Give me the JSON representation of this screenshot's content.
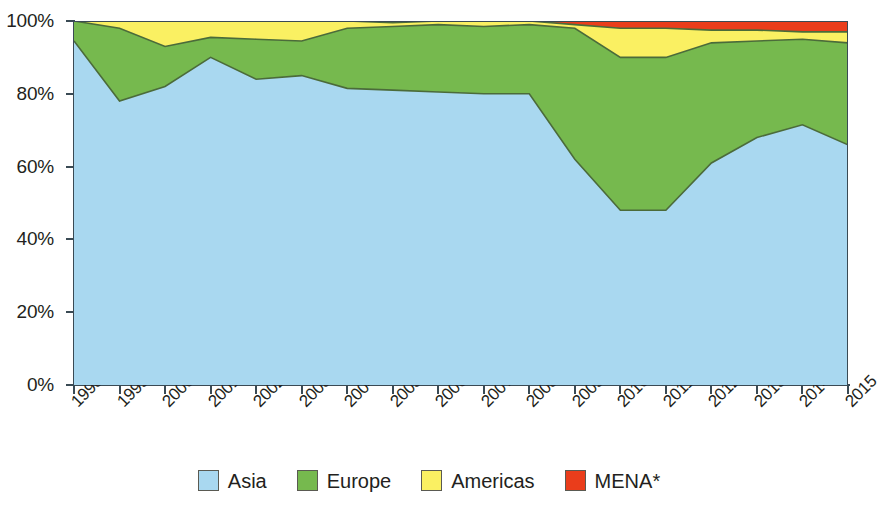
{
  "chart_data": {
    "type": "area",
    "stacked": true,
    "stack_total": 100,
    "title": "",
    "subtitle": "",
    "xlabel": "",
    "ylabel": "",
    "categories": [
      "1998",
      "1999",
      "2000",
      "2001",
      "2002",
      "2003",
      "2004",
      "2005",
      "2006",
      "2007",
      "2008",
      "2009",
      "2010",
      "2011",
      "2012",
      "2013",
      "2014",
      "2015"
    ],
    "ylim": [
      0,
      100
    ],
    "xlim_labels": [
      "1998",
      "2015"
    ],
    "y_tick_labels": [
      "0%",
      "20%",
      "40%",
      "60%",
      "80%",
      "100%"
    ],
    "y_tick_values": [
      0,
      20,
      40,
      60,
      80,
      100
    ],
    "grid": false,
    "legend_position": "bottom",
    "value_unit": "%",
    "series": [
      {
        "name": "Asia",
        "color": "#a9d8f0",
        "values": [
          94.5,
          78.0,
          82.0,
          90.0,
          84.0,
          85.0,
          81.5,
          81.0,
          80.5,
          80.0,
          80.0,
          62.0,
          48.0,
          48.0,
          61.0,
          68.0,
          71.5,
          66.0
        ]
      },
      {
        "name": "Europe",
        "color": "#76b94e",
        "values": [
          5.5,
          20.0,
          11.0,
          5.5,
          11.0,
          9.5,
          16.5,
          17.5,
          18.5,
          18.5,
          19.0,
          36.0,
          42.0,
          42.0,
          33.0,
          26.5,
          23.5,
          28.0
        ]
      },
      {
        "name": "Americas",
        "color": "#faf062",
        "values": [
          0.0,
          2.0,
          7.0,
          4.5,
          5.0,
          5.5,
          2.0,
          1.0,
          1.0,
          1.5,
          1.0,
          1.0,
          8.0,
          8.0,
          3.5,
          3.0,
          2.0,
          3.0
        ]
      },
      {
        "name": "MENA*",
        "color": "#ea3d1b",
        "values": [
          0.0,
          0.0,
          0.0,
          0.0,
          0.0,
          0.0,
          0.0,
          0.0,
          0.0,
          0.0,
          0.0,
          1.0,
          2.0,
          2.0,
          2.5,
          2.5,
          3.0,
          3.0
        ]
      }
    ],
    "cumulative_top_boundaries": {
      "asia": [
        94.5,
        78.0,
        82.0,
        90.0,
        84.0,
        85.0,
        81.5,
        81.0,
        80.5,
        80.0,
        80.0,
        62.0,
        48.0,
        48.0,
        61.0,
        68.0,
        71.5,
        66.0
      ],
      "europe": [
        100.0,
        98.0,
        93.0,
        95.5,
        95.0,
        94.5,
        98.0,
        98.5,
        99.0,
        98.5,
        99.0,
        98.0,
        90.0,
        90.0,
        94.0,
        94.5,
        95.0,
        94.0
      ],
      "americas": [
        100.0,
        100.0,
        100.0,
        100.0,
        100.0,
        100.0,
        100.0,
        100.0,
        100.0,
        100.0,
        100.0,
        99.0,
        98.0,
        98.0,
        97.5,
        97.5,
        97.0,
        97.0
      ],
      "mena": [
        100.0,
        100.0,
        100.0,
        100.0,
        100.0,
        100.0,
        100.0,
        100.0,
        100.0,
        100.0,
        100.0,
        100.0,
        100.0,
        100.0,
        100.0,
        100.0,
        100.0,
        100.0
      ]
    }
  },
  "legend": {
    "items": [
      {
        "label": "Asia",
        "color": "#a9d8f0"
      },
      {
        "label": "Europe",
        "color": "#76b94e"
      },
      {
        "label": "Americas",
        "color": "#faf062"
      },
      {
        "label": "MENA*",
        "color": "#ea3d1b"
      }
    ]
  },
  "axes": {
    "y_labels": [
      "100%",
      "80%",
      "60%",
      "40%",
      "20%",
      "0%"
    ],
    "x_labels": [
      "1998",
      "1999",
      "2000",
      "2001",
      "2002",
      "2003",
      "2004",
      "2005",
      "2006",
      "2007",
      "2008",
      "2009",
      "2010",
      "2011",
      "2012",
      "2013",
      "2014",
      "2015"
    ]
  },
  "style": {
    "axis_color": "#3a4a54",
    "series_outline": "#4b6b3a",
    "background": "#ffffff"
  }
}
